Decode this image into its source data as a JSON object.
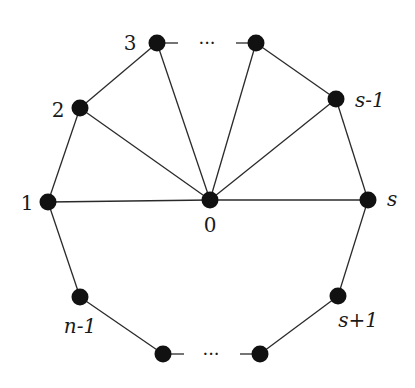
{
  "diagram": {
    "type": "graph",
    "nodes": [
      {
        "id": "0",
        "label": "0"
      },
      {
        "id": "1",
        "label": "1"
      },
      {
        "id": "2",
        "label": "2"
      },
      {
        "id": "3",
        "label": "3"
      },
      {
        "id": "t",
        "label": ""
      },
      {
        "id": "s-1",
        "label": "s-1"
      },
      {
        "id": "s",
        "label": "s"
      },
      {
        "id": "s+1",
        "label": "s+1"
      },
      {
        "id": "b",
        "label": ""
      },
      {
        "id": "c",
        "label": ""
      },
      {
        "id": "n-1",
        "label": "n-1"
      }
    ],
    "edges": [
      [
        "1",
        "2"
      ],
      [
        "2",
        "3"
      ],
      [
        "t",
        "s-1"
      ],
      [
        "s-1",
        "s"
      ],
      [
        "s",
        "s+1"
      ],
      [
        "s+1",
        "b"
      ],
      [
        "c",
        "n-1"
      ],
      [
        "n-1",
        "1"
      ],
      [
        "0",
        "1"
      ],
      [
        "0",
        "2"
      ],
      [
        "0",
        "3"
      ],
      [
        "0",
        "t"
      ],
      [
        "0",
        "s-1"
      ],
      [
        "0",
        "s"
      ]
    ],
    "ellipsis": {
      "top": "···",
      "bottom": "···"
    }
  }
}
